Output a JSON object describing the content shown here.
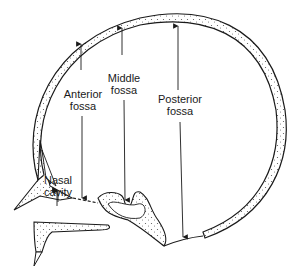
{
  "diagram": {
    "type": "anatomical-section",
    "colors": {
      "background": "#ffffff",
      "line": "#1a1a1a",
      "stipple": "#555555"
    },
    "labels": {
      "anterior_fossa": {
        "line1": "Anterior",
        "line2": "fossa"
      },
      "middle_fossa": {
        "line1": "Middle",
        "line2": "fossa"
      },
      "posterior_fossa": {
        "line1": "Posterior",
        "line2": "fossa"
      },
      "nasal_cavity": {
        "line1": "Nasal",
        "line2": "cavity"
      }
    }
  }
}
